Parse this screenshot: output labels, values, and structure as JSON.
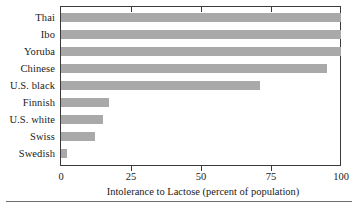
{
  "chart_data": {
    "type": "bar",
    "orientation": "horizontal",
    "title": "",
    "xlabel": "Intolerance to Lactose (percent of population)",
    "ylabel": "",
    "xlim": [
      0,
      100
    ],
    "xticks": [
      "0",
      "25",
      "50",
      "75",
      "100"
    ],
    "xtick_values": [
      0,
      25,
      50,
      75,
      100
    ],
    "grid": false,
    "legend": null,
    "bar_color": "#a9a9a9",
    "categories": [
      "Thai",
      "Ibo",
      "Yoruba",
      "Chinese",
      "U.S. black",
      "Finnish",
      "U.S. white",
      "Swiss",
      "Swedish"
    ],
    "values": [
      100,
      100,
      100,
      95,
      71,
      17,
      15,
      12,
      2
    ]
  },
  "axis": {
    "x_title": "Intolerance to Lactose (percent of population)",
    "ticks": [
      {
        "label": "0",
        "value": 0
      },
      {
        "label": "25",
        "value": 25
      },
      {
        "label": "50",
        "value": 50
      },
      {
        "label": "75",
        "value": 75
      },
      {
        "label": "100",
        "value": 100
      }
    ]
  },
  "bars": [
    {
      "label": "Thai",
      "value": 100
    },
    {
      "label": "Ibo",
      "value": 100
    },
    {
      "label": "Yoruba",
      "value": 100
    },
    {
      "label": "Chinese",
      "value": 95
    },
    {
      "label": "U.S. black",
      "value": 71
    },
    {
      "label": "Finnish",
      "value": 17
    },
    {
      "label": "U.S. white",
      "value": 15
    },
    {
      "label": "Swiss",
      "value": 12
    },
    {
      "label": "Swedish",
      "value": 2
    }
  ]
}
